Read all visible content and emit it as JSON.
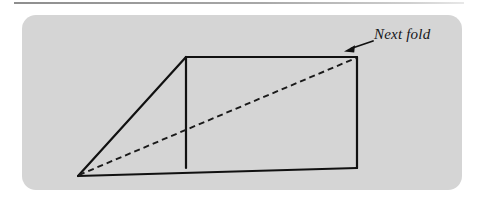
{
  "figure": {
    "panel": {
      "fill_color": "#d5d5d5",
      "corner_radius": 14,
      "x": 22,
      "y": 15,
      "width": 440,
      "height": 175
    },
    "top_rule": {
      "color": "#9a9a9a",
      "x": 14,
      "y": 2,
      "width": 450,
      "height": 2
    },
    "annotation": {
      "label": "Next fold",
      "style": "italic-serif",
      "color": "#16161a",
      "font_size": 15
    },
    "arrow": {
      "name": "pointer-arrow",
      "from_x": 373,
      "from_y": 41,
      "to_x": 346,
      "to_y": 50,
      "color": "#111111",
      "points_to": "rectangle-top-right-corner"
    },
    "stroke_color": "#111111",
    "stroke_width": 2.2,
    "dash_color": "#1a1a1a",
    "dash_pattern": "6 4",
    "vertices": {
      "apex_left": {
        "x": 78,
        "y": 176,
        "label": "left-apex"
      },
      "triangle_top": {
        "x": 186,
        "y": 57,
        "label": "triangle-top-vertex"
      },
      "rect_top_right": {
        "x": 357,
        "y": 57,
        "label": "rect-top-right"
      },
      "rect_bottom_right": {
        "x": 357,
        "y": 168,
        "label": "rect-bottom-right"
      },
      "rect_bottom_left": {
        "x": 186,
        "y": 168,
        "label": "rect-bottom-left"
      }
    },
    "shapes": {
      "triangle": "78,176 186,57 186,168",
      "rectangle": "186,57 357,57 357,168 186,168",
      "baseline": "78,176 357,168",
      "divider": "186,57 186,168",
      "dashed_diagonal": "78,176 357,57"
    }
  }
}
